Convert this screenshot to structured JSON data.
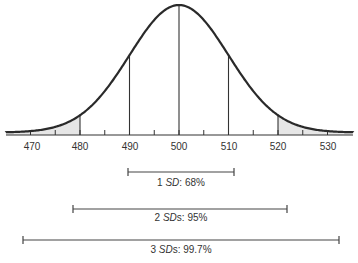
{
  "chart_data": {
    "type": "area",
    "title": "",
    "mean": 500,
    "sd": 10,
    "xlabel": "",
    "ylabel": "",
    "xlim": [
      465,
      535
    ],
    "x_ticks_major": [
      470,
      480,
      490,
      500,
      510,
      520,
      530
    ],
    "x_ticks_minor": [
      475,
      485,
      495,
      505,
      515,
      525
    ],
    "grid": false,
    "vertical_lines": [
      480,
      490,
      500,
      510,
      520
    ],
    "shaded_regions": [
      {
        "from": 465,
        "to": 480,
        "color": "#e6e6e6"
      },
      {
        "from": 520,
        "to": 535,
        "color": "#e6e6e6"
      }
    ],
    "ranges": [
      {
        "label_prefix": "1 ",
        "label_italic": "SD",
        "label_suffix": ": 68%",
        "from": 490,
        "to": 510,
        "percent": 68
      },
      {
        "label_prefix": "2 ",
        "label_italic": "SD",
        "label_suffix2": "s: 95%",
        "from": 480,
        "to": 520,
        "percent": 95
      },
      {
        "label_prefix": "3 ",
        "label_italic": "SD",
        "label_suffix2": "s: 99.7%",
        "from": 470,
        "to": 530,
        "percent": 99.7
      }
    ]
  },
  "labels": {
    "ticks": [
      "470",
      "480",
      "490",
      "500",
      "510",
      "520",
      "530"
    ],
    "range1": {
      "num": "1 ",
      "sd": "SD",
      "rest": ": 68%"
    },
    "range2": {
      "num": "2 ",
      "sd": "SD",
      "rest": "s: 95%"
    },
    "range3": {
      "num": "3 ",
      "sd": "SD",
      "rest": "s: 99.7%"
    }
  },
  "colors": {
    "curve": "#2a2a2a",
    "axis": "#333333",
    "shade": "#e6e6e6",
    "text": "#333333"
  }
}
